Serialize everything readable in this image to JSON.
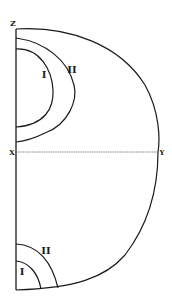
{
  "diagram": {
    "labels": {
      "z": "Z",
      "x": "X",
      "y": "Y",
      "upper_inner": "I",
      "upper_outer": "II",
      "lower_inner": "I",
      "lower_outer": "II"
    },
    "colors": {
      "stroke": "#1a1a1a",
      "axis": "#555555",
      "background": "#ffffff"
    }
  }
}
